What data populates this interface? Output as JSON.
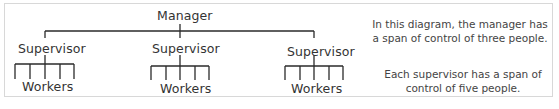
{
  "diagram": {
    "root": "Manager",
    "supervisors": [
      {
        "label": "Supervisor",
        "workers_label": "Workers",
        "worker_count": 5
      },
      {
        "label": "Supervisor",
        "workers_label": "Workers",
        "worker_count": 5
      },
      {
        "label": "Supervisor",
        "workers_label": "Workers",
        "worker_count": 5
      }
    ]
  },
  "notes": {
    "manager_span": "In this diagram, the manager has a span of control of three people.",
    "supervisor_span": "Each supervisor has a span of control of five people."
  },
  "colors": {
    "line": "#2a2a2a",
    "border": "#d8d8d8"
  }
}
